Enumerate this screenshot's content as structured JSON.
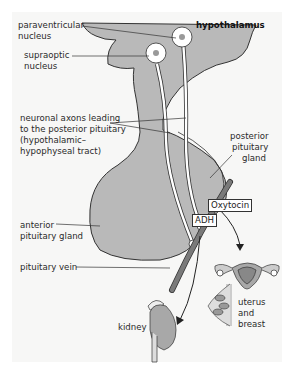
{
  "diagram": {
    "title": "hypothalamus",
    "colors": {
      "tissue_fill": "#b9b9b9",
      "outline": "#333333",
      "background_panel": "#f7f7f6",
      "vein_fill": "#7a7a7a",
      "axon_fill": "#ffffff",
      "organ_fill": "#a8a8a8"
    },
    "labels": {
      "paraventricular_1": "paraventricular",
      "paraventricular_2": "nucleus",
      "supraoptic_1": "supraoptic",
      "supraoptic_2": "nucleus",
      "axons_1": "neuronal axons leading",
      "axons_2": "to the posterior pituitary",
      "axons_3": "(hypothalamic–",
      "axons_4": "hypophyseal tract)",
      "posterior_1": "posterior",
      "posterior_2": "pituitary",
      "posterior_3": "gland",
      "anterior_1": "anterior",
      "anterior_2": "pituitary gland",
      "vein": "pituitary vein",
      "kidney": "kidney",
      "uterus_1": "uterus",
      "uterus_2": "and",
      "uterus_3": "breast"
    },
    "hormones": {
      "oxytocin": "Oxytocin",
      "adh": "ADH"
    }
  }
}
